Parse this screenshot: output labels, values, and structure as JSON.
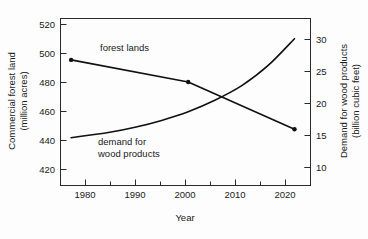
{
  "chart_data": {
    "type": "line",
    "title": "",
    "xlabel": "Year",
    "ylabel": "Commercial forest land (million acres)",
    "ylabel_right": "Demand for wood products (billion cubic feet)",
    "xlim": [
      1976,
      2023
    ],
    "ylim": [
      415,
      528
    ],
    "ylim_right": [
      3.5,
      32.5
    ],
    "grid": false,
    "legend_position": "inline-annotations",
    "x_ticks": [
      1980,
      1990,
      2000,
      2010,
      2020
    ],
    "x_minor_ticks": [
      1985,
      1995,
      2005,
      2015
    ],
    "y_ticks_left": [
      420,
      440,
      460,
      480,
      500,
      520
    ],
    "y_ticks_right": [
      10,
      15,
      20,
      25,
      30
    ],
    "y_minor_ticks_right": [
      5
    ],
    "series": [
      {
        "name": "forest lands",
        "axis": "left",
        "label": "forest lands",
        "markers": true,
        "x": [
          1978,
          2000,
          2020
        ],
        "values": [
          500,
          485,
          453
        ]
      },
      {
        "name": "demand for wood products",
        "axis": "right",
        "label": "demand for wood products",
        "markers": false,
        "x": [
          1978,
          1985,
          1990,
          1995,
          2000,
          2005,
          2010,
          2015,
          2020
        ],
        "values": [
          11.8,
          12.7,
          13.6,
          14.8,
          16.3,
          18.3,
          20.8,
          24.3,
          29.0
        ]
      }
    ]
  },
  "axes": {
    "x_title": "Year",
    "y_left_title_line1": "Commercial forest land",
    "y_left_title_line2": "(million acres)",
    "y_right_title_line1": "Demand for wood products",
    "y_right_title_line2": "(billion cubic feet)",
    "x_tick_labels": [
      "1980",
      "1990",
      "2000",
      "2010",
      "2020"
    ],
    "y_left_tick_labels": [
      "520",
      "500",
      "480",
      "460",
      "440",
      "420"
    ],
    "y_right_tick_labels": [
      "30",
      "25",
      "20",
      "15",
      "10"
    ]
  },
  "annotations": {
    "forest_lands": "forest lands",
    "demand_line1": "demand for",
    "demand_line2": "wood products"
  },
  "colors": {
    "line": "#111111",
    "axis": "#2a2a2a",
    "text": "#1a1a1a",
    "background": "#fdfdfd"
  }
}
